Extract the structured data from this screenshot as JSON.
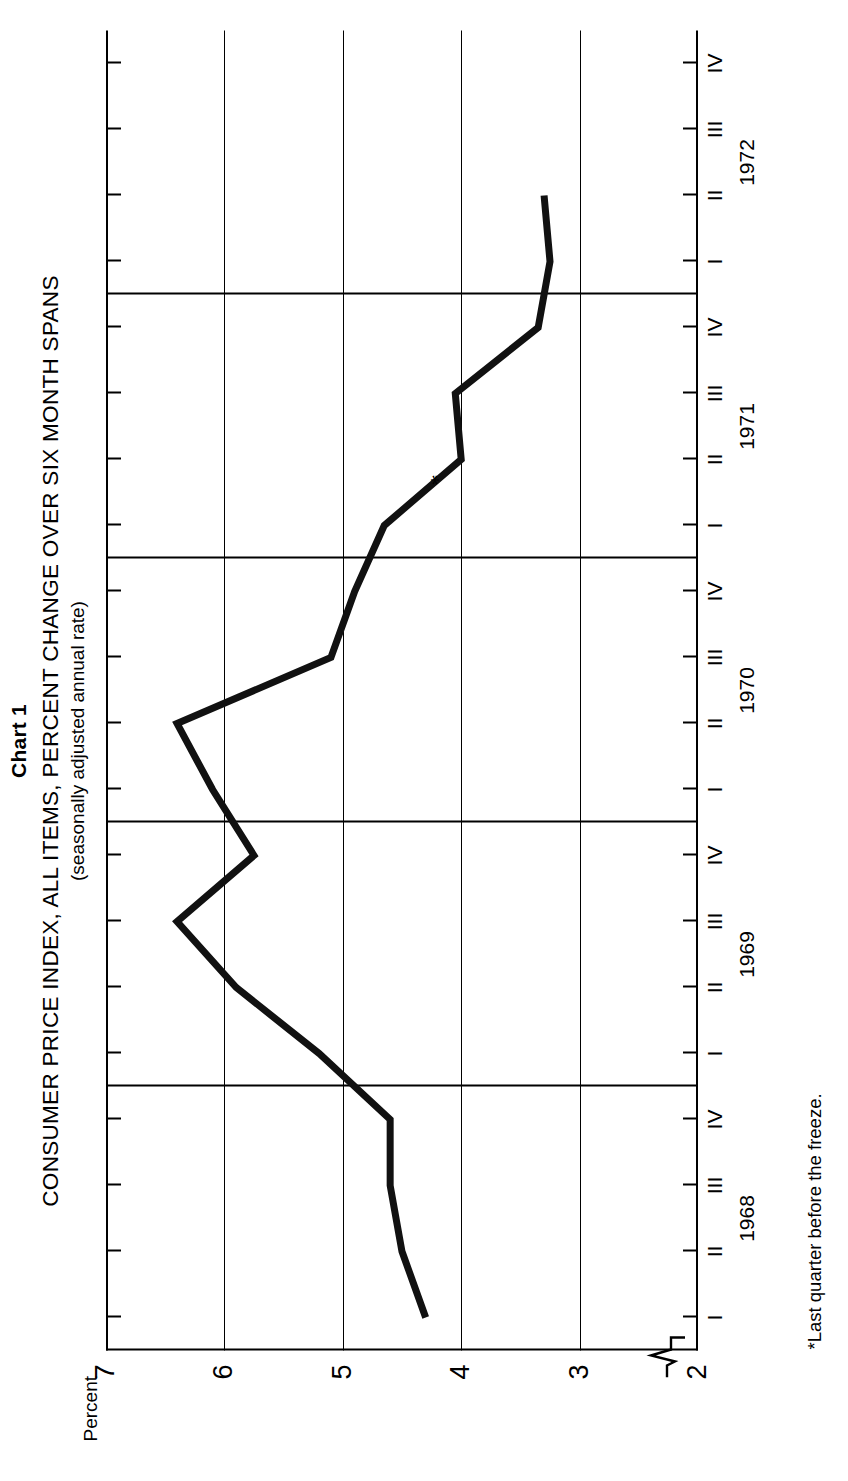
{
  "header": {
    "chart_number": "Chart 1",
    "title": "CONSUMER PRICE INDEX, ALL ITEMS, PERCENT CHANGE OVER SIX MONTH SPANS",
    "subtitle": "(seasonally adjusted annual rate)"
  },
  "axes": {
    "value_axis_label": "Percent",
    "value_ticks": [
      "7",
      "6",
      "5",
      "4",
      "3",
      "2"
    ],
    "axis_break_marker": "zigzag",
    "quarter_labels": [
      "I",
      "II",
      "III",
      "IV"
    ],
    "years": [
      "1968",
      "1969",
      "1970",
      "1971",
      "1972"
    ]
  },
  "annotations": {
    "star_marker": "*",
    "footnote": "*Last quarter before the freeze."
  },
  "style": {
    "line_color": "#111111",
    "axis_color": "#000000",
    "background": "#ffffff"
  },
  "chart_data": {
    "type": "line",
    "title": "CONSUMER PRICE INDEX, ALL ITEMS, PERCENT CHANGE OVER SIX MONTH SPANS",
    "subtitle": "(seasonally adjusted annual rate)",
    "xlabel": "",
    "ylabel": "Percent",
    "ylim": [
      2,
      7
    ],
    "yticks": [
      7,
      6,
      5,
      4,
      3,
      2
    ],
    "grid": true,
    "grid_orientation": "year-dividers",
    "legend": "none",
    "x": [
      "1968 I",
      "1968 II",
      "1968 III",
      "1968 IV",
      "1969 I",
      "1969 II",
      "1969 III",
      "1969 IV",
      "1970 I",
      "1970 II",
      "1970 III",
      "1970 IV",
      "1971 I",
      "1971 II",
      "1971 III",
      "1971 IV",
      "1972 I",
      "1972 II"
    ],
    "values": [
      4.3,
      4.5,
      4.6,
      4.6,
      5.2,
      5.9,
      6.4,
      5.75,
      6.1,
      6.4,
      5.1,
      4.9,
      4.65,
      4.0,
      4.05,
      3.35,
      3.25,
      3.3
    ],
    "series": [
      {
        "name": "CPI, all items, percent change over six month spans",
        "values": [
          4.3,
          4.5,
          4.6,
          4.6,
          5.2,
          5.9,
          6.4,
          5.75,
          6.1,
          6.4,
          5.1,
          4.9,
          4.65,
          4.0,
          4.05,
          3.35,
          3.25,
          3.3
        ]
      }
    ],
    "annotated_points": [
      {
        "x": "1971 II",
        "y": 4.0,
        "marker": "*",
        "note": "Last quarter before the freeze."
      }
    ]
  }
}
